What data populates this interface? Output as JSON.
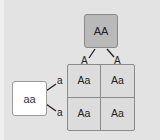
{
  "diagram": {
    "type": "punnett-square",
    "top_parent": {
      "genotype": "AA",
      "alleles": [
        "A",
        "A"
      ],
      "fill": "#b9b9b9"
    },
    "left_parent": {
      "genotype": "aa",
      "alleles": [
        "a",
        "a"
      ],
      "fill": "#ffffff"
    },
    "offspring": [
      {
        "row": 0,
        "col": 0,
        "genotype": "Aa"
      },
      {
        "row": 0,
        "col": 1,
        "genotype": "Aa"
      },
      {
        "row": 1,
        "col": 0,
        "genotype": "Aa"
      },
      {
        "row": 1,
        "col": 1,
        "genotype": "Aa"
      }
    ],
    "grid_fill": "#dcdcdc",
    "background": "#e3e3e3"
  }
}
